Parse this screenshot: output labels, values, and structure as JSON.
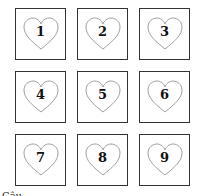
{
  "cards": [
    {
      "label": "1"
    },
    {
      "label": "2"
    },
    {
      "label": "3"
    },
    {
      "label": "4"
    },
    {
      "label": "5"
    },
    {
      "label": "6"
    },
    {
      "label": "7"
    },
    {
      "label": "8"
    },
    {
      "label": "9"
    }
  ],
  "footer_text": "Câu ..."
}
